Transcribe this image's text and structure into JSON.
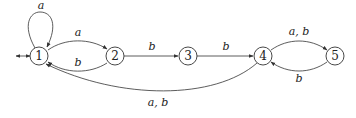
{
  "diagram": {
    "type": "finite-automaton",
    "nodes": [
      {
        "id": "1",
        "label": "1",
        "start": true
      },
      {
        "id": "2",
        "label": "2"
      },
      {
        "id": "3",
        "label": "3"
      },
      {
        "id": "4",
        "label": "4"
      },
      {
        "id": "5",
        "label": "5"
      }
    ],
    "edges": [
      {
        "from": "1",
        "to": "1",
        "label": "a"
      },
      {
        "from": "1",
        "to": "2",
        "label": "a"
      },
      {
        "from": "2",
        "to": "1",
        "label": "b"
      },
      {
        "from": "2",
        "to": "3",
        "label": "b"
      },
      {
        "from": "3",
        "to": "4",
        "label": "b"
      },
      {
        "from": "4",
        "to": "5",
        "label": "a, b"
      },
      {
        "from": "5",
        "to": "4",
        "label": "b"
      },
      {
        "from": "4",
        "to": "1",
        "label": "a, b"
      }
    ]
  }
}
